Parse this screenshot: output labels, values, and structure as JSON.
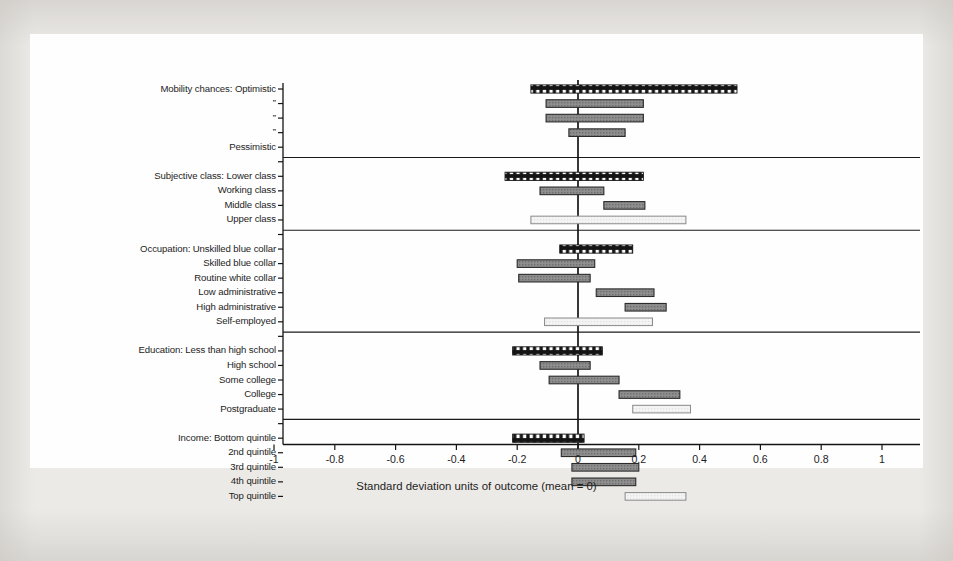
{
  "figure": {
    "background_color": "#eceae7",
    "plate_color": "#fefefe",
    "axis_color": "#141414"
  },
  "chart_data": {
    "type": "bar",
    "orientation": "horizontal",
    "title": "",
    "xlabel": "Standard deviation units of outcome (mean = 0)",
    "ylabel": "",
    "xlim": [
      -1,
      1
    ],
    "xticks": [
      -1,
      -0.8,
      -0.6,
      -0.4,
      -0.2,
      0,
      0.2,
      0.4,
      0.6,
      0.8,
      1
    ],
    "xticklabels": [
      "-1",
      "-0.8",
      "-0.6",
      "-0.4",
      "-0.2",
      "0",
      "0.2",
      "0.4",
      "0.6",
      "0.8",
      "1"
    ],
    "grid": false,
    "zero_reference_line": 0,
    "legend": "none",
    "note": "Each bar is a confidence interval spanning from low to high in standard deviation units. Bar styles: checkered = reference/first category, filled = mid-gray, open = light/hollow.",
    "groups": [
      {
        "name": "Mobility chances",
        "bars": [
          {
            "label": "Mobility chances: Optimistic",
            "low": -0.155,
            "high": 0.523,
            "style": "checkered"
          },
          {
            "label": "”",
            "low": -0.105,
            "high": 0.215,
            "style": "filled"
          },
          {
            "label": "”",
            "low": -0.105,
            "high": 0.215,
            "style": "filled"
          },
          {
            "label": "”",
            "low": -0.03,
            "high": 0.155,
            "style": "filled"
          },
          {
            "label": "Pessimistic",
            "low": 0.0,
            "high": 0.0,
            "style": "none"
          }
        ]
      },
      {
        "name": "Subjective class",
        "bars": [
          {
            "label": "Subjective class: Lower class",
            "low": -0.24,
            "high": 0.215,
            "style": "checkered"
          },
          {
            "label": "Working class",
            "low": -0.125,
            "high": 0.085,
            "style": "filled"
          },
          {
            "label": "Middle class",
            "low": 0.085,
            "high": 0.22,
            "style": "filled"
          },
          {
            "label": "Upper class",
            "low": -0.155,
            "high": 0.355,
            "style": "open"
          }
        ]
      },
      {
        "name": "Occupation",
        "bars": [
          {
            "label": "Occupation: Unskilled blue collar",
            "low": -0.06,
            "high": 0.18,
            "style": "checkered"
          },
          {
            "label": "Skilled blue collar",
            "low": -0.2,
            "high": 0.055,
            "style": "filled"
          },
          {
            "label": "Routine white collar",
            "low": -0.195,
            "high": 0.04,
            "style": "filled"
          },
          {
            "label": "Low administrative",
            "low": 0.06,
            "high": 0.25,
            "style": "filled"
          },
          {
            "label": "High administrative",
            "low": 0.155,
            "high": 0.29,
            "style": "filled"
          },
          {
            "label": "Self-employed",
            "low": -0.11,
            "high": 0.245,
            "style": "open"
          }
        ]
      },
      {
        "name": "Education",
        "bars": [
          {
            "label": "Education: Less than high school",
            "low": -0.215,
            "high": 0.08,
            "style": "checkered"
          },
          {
            "label": "High school",
            "low": -0.125,
            "high": 0.04,
            "style": "filled"
          },
          {
            "label": "Some college",
            "low": -0.095,
            "high": 0.135,
            "style": "filled"
          },
          {
            "label": "College",
            "low": 0.135,
            "high": 0.335,
            "style": "filled"
          },
          {
            "label": "Postgraduate",
            "low": 0.18,
            "high": 0.37,
            "style": "open"
          }
        ]
      },
      {
        "name": "Income",
        "bars": [
          {
            "label": "Income: Bottom quintile",
            "low": -0.215,
            "high": 0.02,
            "style": "checkered"
          },
          {
            "label": "2nd quintile",
            "low": -0.055,
            "high": 0.19,
            "style": "filled"
          },
          {
            "label": "3rd quintile",
            "low": -0.02,
            "high": 0.2,
            "style": "filled"
          },
          {
            "label": "4th quintile",
            "low": -0.02,
            "high": 0.19,
            "style": "filled"
          },
          {
            "label": "Top quintile",
            "low": 0.155,
            "high": 0.355,
            "style": "open"
          }
        ]
      }
    ]
  }
}
